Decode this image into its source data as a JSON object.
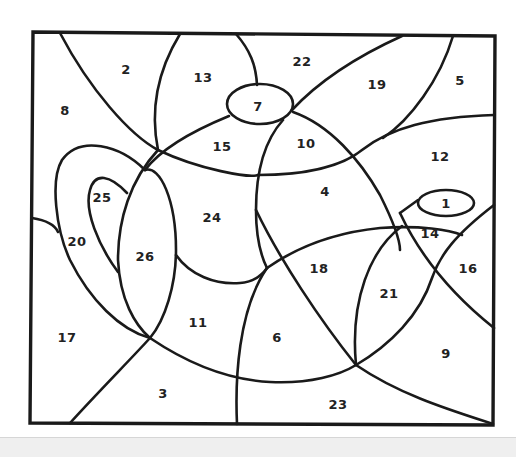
{
  "worksheet": {
    "type": "color-by-number",
    "subject": "teapot",
    "regions": [
      {
        "label": "1",
        "x": 446,
        "y": 203
      },
      {
        "label": "2",
        "x": 126,
        "y": 69
      },
      {
        "label": "3",
        "x": 163,
        "y": 393
      },
      {
        "label": "4",
        "x": 325,
        "y": 191
      },
      {
        "label": "5",
        "x": 460,
        "y": 80
      },
      {
        "label": "6",
        "x": 277,
        "y": 337
      },
      {
        "label": "7",
        "x": 258,
        "y": 106
      },
      {
        "label": "8",
        "x": 65,
        "y": 110
      },
      {
        "label": "9",
        "x": 446,
        "y": 353
      },
      {
        "label": "10",
        "x": 306,
        "y": 143
      },
      {
        "label": "11",
        "x": 198,
        "y": 322
      },
      {
        "label": "12",
        "x": 440,
        "y": 156
      },
      {
        "label": "13",
        "x": 203,
        "y": 77
      },
      {
        "label": "14",
        "x": 430,
        "y": 233
      },
      {
        "label": "15",
        "x": 222,
        "y": 146
      },
      {
        "label": "16",
        "x": 468,
        "y": 268
      },
      {
        "label": "17",
        "x": 67,
        "y": 337
      },
      {
        "label": "18",
        "x": 319,
        "y": 268
      },
      {
        "label": "19",
        "x": 377,
        "y": 84
      },
      {
        "label": "20",
        "x": 77,
        "y": 241
      },
      {
        "label": "21",
        "x": 389,
        "y": 293
      },
      {
        "label": "22",
        "x": 302,
        "y": 61
      },
      {
        "label": "23",
        "x": 338,
        "y": 404
      },
      {
        "label": "24",
        "x": 212,
        "y": 217
      },
      {
        "label": "25",
        "x": 102,
        "y": 197
      },
      {
        "label": "26",
        "x": 145,
        "y": 256
      }
    ]
  },
  "colors": {
    "line": "#1a1a1a",
    "label": "#222222",
    "background": "#ffffff",
    "bottom_band": "#efefef"
  }
}
